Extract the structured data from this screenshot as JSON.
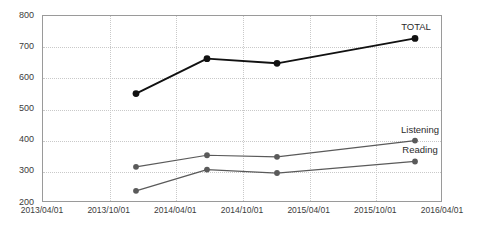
{
  "chart_data": {
    "type": "line",
    "title": "",
    "subtitle": "",
    "xlabel": "",
    "ylabel": "",
    "ylim": [
      200,
      800
    ],
    "ytick_step": 100,
    "yticks": [
      200,
      300,
      400,
      500,
      600,
      700,
      800
    ],
    "ytick_labels": [
      "200",
      "300",
      "400",
      "500",
      "600",
      "700",
      "800"
    ],
    "xticks": [
      "2013/04/01",
      "2013/10/01",
      "2014/04/01",
      "2014/10/01",
      "2015/04/01",
      "2015/10/01",
      "2016/04/01"
    ],
    "xlim": [
      "2013/04/01",
      "2016/04/01"
    ],
    "grid": "both-dotted",
    "legend": "inline-end-of-line",
    "x": [
      "2013/12/01",
      "2014/07/01",
      "2015/01/01",
      "2015/12/01"
    ],
    "series": [
      {
        "name": "TOTAL",
        "color": "#111111",
        "line_width": 1.9,
        "marker": "circle",
        "marker_size": 3.4,
        "values": [
          548,
          660,
          645,
          725
        ],
        "label_x_frac": 0.935,
        "label_y_value": 762
      },
      {
        "name": "Listening",
        "color": "#5a5a5a",
        "line_width": 1.25,
        "marker": "circle",
        "marker_size": 2.9,
        "values": [
          313,
          350,
          345,
          397
        ],
        "label_x_frac": 0.945,
        "label_y_value": 432
      },
      {
        "name": "Reading",
        "color": "#5a5a5a",
        "line_width": 1.25,
        "marker": "circle",
        "marker_size": 2.9,
        "values": [
          236,
          304,
          293,
          330
        ],
        "label_x_frac": 0.945,
        "label_y_value": 366
      }
    ],
    "colors": {
      "background": "#ffffff",
      "plot_border": "#9a9a9a",
      "gridline": "#c9c9c9",
      "tick_text": "#3b3b3b",
      "total": "#111111",
      "listening": "#5a5a5a",
      "reading": "#5a5a5a"
    }
  }
}
